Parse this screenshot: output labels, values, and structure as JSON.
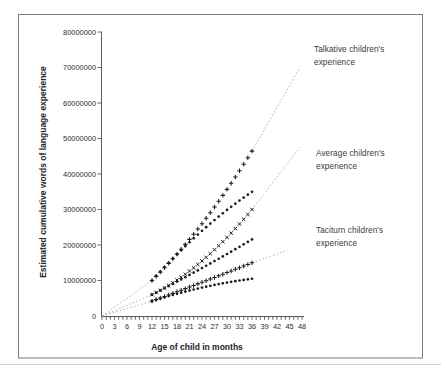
{
  "chart_data": {
    "type": "scatter",
    "title": "",
    "xlabel": "Age of child in months",
    "ylabel": "Estimated cumulative words of language experience",
    "xlim": [
      0,
      48
    ],
    "ylim": [
      0,
      80000000
    ],
    "grid": "off",
    "legend_position": "annotations on plot (no legend box)",
    "x_tick_labels": [
      0,
      3,
      6,
      9,
      12,
      15,
      18,
      21,
      24,
      27,
      30,
      33,
      36,
      39,
      42,
      45,
      48
    ],
    "x_minor_tick_step_months": 1,
    "y_tick_values": [
      0,
      10000000,
      20000000,
      30000000,
      40000000,
      50000000,
      60000000,
      70000000,
      80000000
    ],
    "months": [
      12,
      13,
      14,
      15,
      16,
      17,
      18,
      19,
      20,
      21,
      22,
      23,
      24,
      25,
      26,
      27,
      28,
      29,
      30,
      31,
      32,
      33,
      34,
      35,
      36
    ],
    "series": [
      {
        "id": "talkative-projected",
        "group": "Talkative children's experience",
        "marker": "plus",
        "values_millions": [
          10,
          11.16,
          12.35,
          13.58,
          14.83,
          16.12,
          17.44,
          18.79,
          20.17,
          21.58,
          23.02,
          24.5,
          26,
          27.54,
          29.1,
          30.7,
          32.33,
          33.98,
          35.67,
          37.39,
          39.14,
          40.92,
          42.73,
          44.58,
          46.45
        ],
        "leader_from_origin": true,
        "extension": {
          "month": 47.5,
          "value_millions": 70
        }
      },
      {
        "id": "talkative-observed",
        "group": "Talkative children's experience",
        "marker": "dot",
        "values_millions": [
          10,
          11.28,
          12.54,
          13.78,
          15,
          16.2,
          17.38,
          18.53,
          19.67,
          20.78,
          21.88,
          22.95,
          24,
          25.03,
          26.04,
          27.03,
          28,
          28.94,
          29.87,
          30.77,
          31.65,
          32.52,
          33.36,
          34.18,
          34.98
        ]
      },
      {
        "id": "average-projected",
        "group": "Average children's experience",
        "marker": "cross",
        "values_millions": [
          6,
          6.6,
          7.24,
          7.91,
          8.61,
          9.35,
          10.13,
          10.93,
          11.78,
          12.66,
          13.57,
          14.52,
          15.5,
          16.52,
          17.57,
          18.66,
          19.78,
          20.94,
          22.13,
          23.35,
          24.61,
          25.91,
          27.24,
          28.6,
          30
        ],
        "leader_from_origin": true,
        "extension": {
          "month": 47.5,
          "value_millions": 47.5
        }
      },
      {
        "id": "average-observed",
        "group": "Average children's experience",
        "marker": "dot",
        "values_millions": [
          6,
          6.61,
          7.22,
          7.83,
          8.44,
          9.06,
          9.69,
          10.31,
          10.94,
          11.58,
          12.21,
          12.85,
          13.5,
          14.15,
          14.8,
          15.46,
          16.12,
          16.79,
          17.46,
          18.13,
          18.81,
          19.49,
          20.18,
          20.87,
          21.57
        ]
      },
      {
        "id": "taciturn-projected",
        "group": "Taciturn children's experience",
        "marker": "plus",
        "values_millions": [
          4.2,
          4.63,
          5.07,
          5.51,
          5.94,
          6.38,
          6.83,
          7.27,
          7.71,
          8.16,
          8.61,
          9.05,
          9.5,
          9.95,
          10.41,
          10.86,
          11.31,
          11.77,
          12.23,
          12.69,
          13.15,
          13.61,
          14.07,
          14.53,
          15
        ],
        "leader_from_origin": true,
        "extension": {
          "month": 44.5,
          "value_millions": 18.5
        }
      },
      {
        "id": "taciturn-observed",
        "group": "Taciturn children's experience",
        "marker": "dot",
        "values_millions": [
          4.2,
          4.57,
          4.92,
          5.27,
          5.61,
          5.94,
          6.26,
          6.57,
          6.88,
          7.17,
          7.46,
          7.73,
          8,
          8.26,
          8.51,
          8.75,
          8.98,
          9.2,
          9.41,
          9.62,
          9.81,
          10,
          10.17,
          10.34,
          10.5
        ]
      }
    ],
    "annotations": [
      {
        "id": "talkative",
        "text": "Talkative children's\nexperience"
      },
      {
        "id": "average",
        "text": "Average children's\nexperience"
      },
      {
        "id": "taciturn",
        "text": "Taciturn children's\nexperience"
      }
    ],
    "colors": {
      "marker": "#1c1c1c",
      "axis": "#5a5a5a",
      "tick_text": "#2e2e2e",
      "dotted_line": "#adadad",
      "frame_border": "#7d7d7d",
      "page_edge_line": "#cfcfcf"
    }
  }
}
